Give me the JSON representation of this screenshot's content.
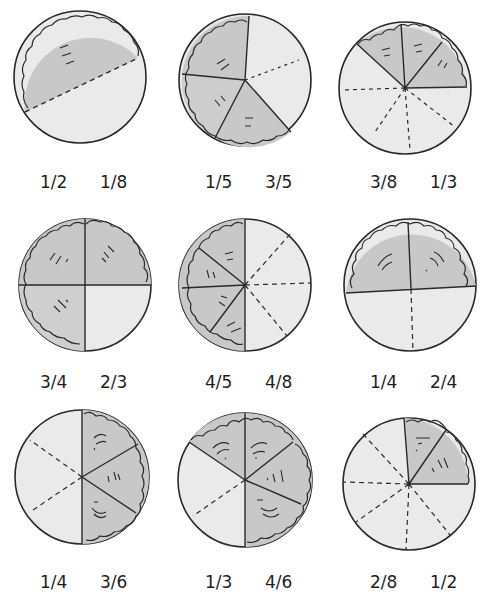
{
  "worksheet": {
    "colors": {
      "shaded": "#c9c9c9",
      "unshaded": "#e9e9e9",
      "ink": "#2a2a2a",
      "background": "#ffffff"
    },
    "pies": [
      {
        "id": 1,
        "row": 1,
        "col": 1,
        "slices": 2,
        "shaded": 1,
        "labels": [
          "1/2",
          "1/8"
        ]
      },
      {
        "id": 2,
        "row": 1,
        "col": 2,
        "slices": 5,
        "shaded": 3,
        "labels": [
          "1/5",
          "3/5"
        ]
      },
      {
        "id": 3,
        "row": 1,
        "col": 3,
        "slices": 8,
        "shaded": 3,
        "labels": [
          "3/8",
          "1/3"
        ]
      },
      {
        "id": 4,
        "row": 2,
        "col": 1,
        "slices": 4,
        "shaded": 3,
        "labels": [
          "3/4",
          "2/3"
        ]
      },
      {
        "id": 5,
        "row": 2,
        "col": 2,
        "slices": 8,
        "shaded": 4,
        "labels": [
          "4/5",
          "4/8"
        ]
      },
      {
        "id": 6,
        "row": 2,
        "col": 3,
        "slices": 4,
        "shaded": 2,
        "labels": [
          "1/4",
          "2/4"
        ]
      },
      {
        "id": 7,
        "row": 3,
        "col": 1,
        "slices": 6,
        "shaded": 3,
        "labels": [
          "1/4",
          "3/6"
        ]
      },
      {
        "id": 8,
        "row": 3,
        "col": 2,
        "slices": 6,
        "shaded": 4,
        "labels": [
          "1/3",
          "4/6"
        ]
      },
      {
        "id": 9,
        "row": 3,
        "col": 3,
        "slices": 8,
        "shaded": 2,
        "labels": [
          "2/8",
          "1/2"
        ]
      }
    ]
  }
}
